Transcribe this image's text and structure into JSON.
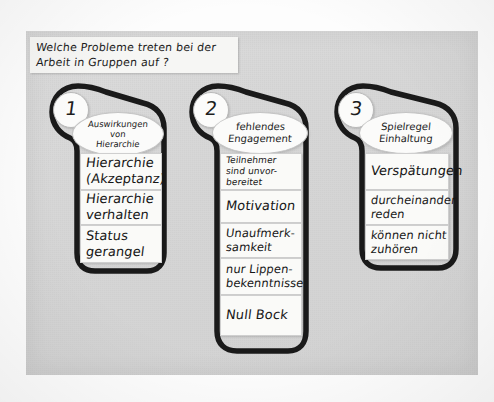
{
  "poster": {
    "title_lines": [
      "Welche Probleme treten bei der",
      "Arbeit in Gruppen auf ?"
    ]
  },
  "columns": [
    {
      "number": "1",
      "heading_lines": [
        "Auswirkungen",
        "von",
        "Hierarchie"
      ],
      "cards": [
        {
          "lines": [
            "Hierarchie",
            "(Akzeptanz)"
          ]
        },
        {
          "lines": [
            "Hierarchie",
            "verhalten"
          ]
        },
        {
          "lines": [
            "Status",
            "gerangel"
          ]
        }
      ]
    },
    {
      "number": "2",
      "heading_lines": [
        "fehlendes",
        "Engagement"
      ],
      "cards": [
        {
          "lines": [
            "Teilnehmer",
            "sind unvor-",
            "bereitet"
          ]
        },
        {
          "lines": [
            "Motivation"
          ]
        },
        {
          "lines": [
            "Unaufmerk-",
            "samkeit"
          ]
        },
        {
          "lines": [
            "nur Lippen-",
            "bekenntnisse"
          ]
        },
        {
          "lines": [
            "Null Bock"
          ]
        }
      ]
    },
    {
      "number": "3",
      "heading_lines": [
        "Spielregel",
        "Einhaltung"
      ],
      "cards": [
        {
          "lines": [
            "Verspätungen"
          ]
        },
        {
          "lines": [
            "durcheinander",
            "reden"
          ]
        },
        {
          "lines": [
            "können nicht",
            "zuhören"
          ]
        }
      ]
    }
  ],
  "colors": {
    "poster_background": "#d8d8d8",
    "card_background": "#fafaf8",
    "ink": "#161616",
    "outline": "#1a1a1a"
  }
}
